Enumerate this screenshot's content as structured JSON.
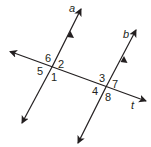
{
  "diagram": {
    "type": "parallel-lines-cut-by-transversal",
    "line_color": "#231f20",
    "lines": {
      "a": {
        "label": "a",
        "parallel_marker": true
      },
      "b": {
        "label": "b",
        "parallel_marker": true
      },
      "t": {
        "label": "t",
        "role": "transversal"
      }
    },
    "angles": {
      "a_intersection": [
        "6",
        "2",
        "5",
        "1"
      ],
      "b_intersection": [
        "3",
        "7",
        "4",
        "8"
      ]
    }
  }
}
